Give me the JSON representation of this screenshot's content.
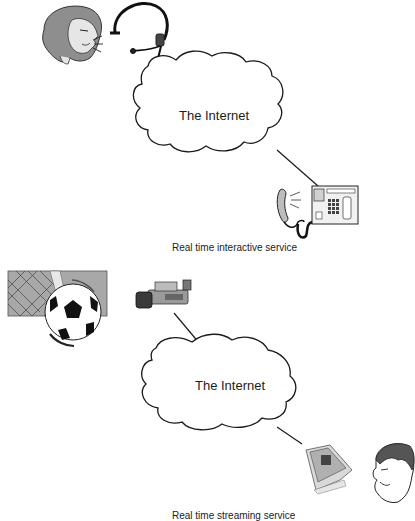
{
  "diagram": {
    "top_panel": {
      "cloud_label": "The Internet",
      "caption": "Real time interactive service",
      "endpoints": [
        "woman-with-headset",
        "desk-phone"
      ]
    },
    "bottom_panel": {
      "cloud_label": "The Internet",
      "caption": "Real time streaming service",
      "endpoints": [
        "soccer-ball-scene",
        "video-camera",
        "monitor",
        "man-viewer"
      ]
    },
    "colors": {
      "line": "#1a1a1a",
      "gray_fill": "#9a9a9a",
      "light_gray": "#cfcfcf",
      "background": "#ffffff"
    }
  }
}
